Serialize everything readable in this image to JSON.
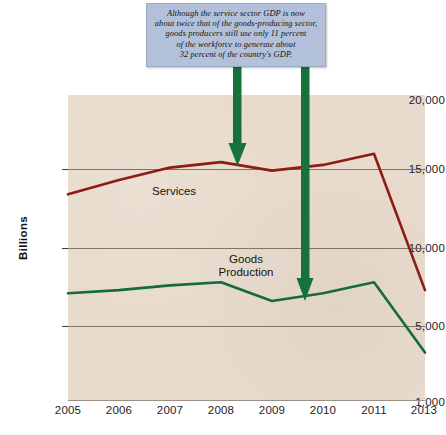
{
  "chart_data": {
    "type": "line",
    "title": "",
    "xlabel": "",
    "ylabel": "Billions",
    "grid": true,
    "legend_position": "inline-labels",
    "x": [
      "2005",
      "2006",
      "2007",
      "2008",
      "2009",
      "2010",
      "2011",
      "2013"
    ],
    "ytick_labels": [
      "20,000",
      "15,000",
      "10,000",
      "5,000",
      "1,000"
    ],
    "ytick_values": [
      20000,
      15000,
      10000,
      5000,
      1000
    ],
    "ylim": [
      1000,
      20000
    ],
    "note_axis": "Vertical axis is broken/non-linear between 5,000 and 1,000; horizontal axis skips 2012",
    "series": [
      {
        "name": "Services",
        "color": "#8c1c14",
        "values": [
          13400,
          14300,
          15100,
          15500,
          14900,
          15300,
          16100,
          7300
        ]
      },
      {
        "name": "Goods Production",
        "color": "#156b3a",
        "values": [
          7100,
          7300,
          7600,
          7800,
          6600,
          7100,
          7800,
          3700
        ]
      }
    ],
    "annotations": [
      {
        "name": "callout-note",
        "text_lines": [
          "Although the service sector GDP is now",
          "about twice that of the goods-producing sector,",
          "goods producers still use only 11 percent",
          "of the workforce to generate about",
          "32 percent of the country's GDP."
        ],
        "background_color": "#b3c0da",
        "arrows": [
          {
            "name": "arrow-to-services",
            "target_series": "Services",
            "target_x": "2008",
            "color": "#15723c"
          },
          {
            "name": "arrow-to-goods",
            "target_series": "Goods Production",
            "target_x": "2010",
            "color": "#15723c"
          }
        ]
      }
    ],
    "series_inline_labels": [
      {
        "name": "Services",
        "text": "Services"
      },
      {
        "name": "Goods Production",
        "text_line1": "Goods",
        "text_line2": "Production"
      }
    ],
    "colors": {
      "plot_background": "#e8dbcd",
      "page_background": "#ffffff",
      "gridline": "#6e6257",
      "services_line": "#8c1c14",
      "goods_line": "#156b3a",
      "arrow": "#15723c",
      "callout_fill": "#b3c0da",
      "text": "#1d1d1d"
    }
  }
}
